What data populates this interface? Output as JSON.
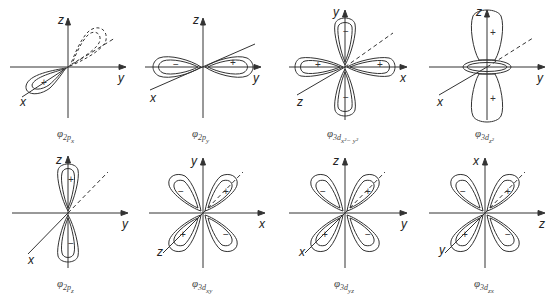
{
  "figure": {
    "stroke_color": "#333333",
    "background": "#ffffff",
    "orbitals": [
      {
        "id": "2px",
        "caption_main": "φ",
        "caption_sub": "2p",
        "caption_subsub": "x",
        "axes": {
          "vertical": "z",
          "horizontal": "y",
          "diagonal": "x"
        },
        "lobes": [
          {
            "sign": "+",
            "direction": "along -x (front-left)",
            "style": "solid"
          },
          {
            "sign": "",
            "direction": "along +x (back-right)",
            "style": "dashed"
          }
        ]
      },
      {
        "id": "2py",
        "caption_main": "φ",
        "caption_sub": "2p",
        "caption_subsub": "y",
        "axes": {
          "vertical": "z",
          "horizontal": "y",
          "diagonal": "x"
        },
        "lobes": [
          {
            "sign": "−",
            "direction": "-y"
          },
          {
            "sign": "+",
            "direction": "+y"
          }
        ]
      },
      {
        "id": "3dx2-y2",
        "caption_main": "φ",
        "caption_sub": "3d",
        "caption_subsub": "x²− y²",
        "axes": {
          "vertical": "y",
          "horizontal": "x",
          "diagonal": "z"
        },
        "lobes": [
          {
            "sign": "−",
            "direction": "+y"
          },
          {
            "sign": "−",
            "direction": "-y"
          },
          {
            "sign": "+",
            "direction": "+x"
          },
          {
            "sign": "+",
            "direction": "-x"
          }
        ]
      },
      {
        "id": "3dz2",
        "caption_main": "φ",
        "caption_sub": "3d",
        "caption_subsub": "z²",
        "axes": {
          "vertical": "z",
          "horizontal": "y",
          "diagonal": "x"
        },
        "lobes": [
          {
            "sign": "+",
            "direction": "+z"
          },
          {
            "sign": "+",
            "direction": "-z"
          },
          {
            "sign": "",
            "direction": "torus xy-plane"
          }
        ]
      },
      {
        "id": "2pz",
        "caption_main": "φ",
        "caption_sub": "2p",
        "caption_subsub": "z",
        "axes": {
          "vertical": "z",
          "horizontal": "y",
          "diagonal": "x"
        },
        "lobes": [
          {
            "sign": "+",
            "direction": "+z"
          },
          {
            "sign": "−",
            "direction": "-z"
          }
        ]
      },
      {
        "id": "3dxy",
        "caption_main": "φ",
        "caption_sub": "3d",
        "caption_subsub": "xy",
        "axes": {
          "vertical": "y",
          "horizontal": "x",
          "diagonal": "z"
        },
        "lobes": [
          {
            "sign": "−",
            "direction": "upper-left"
          },
          {
            "sign": "+",
            "direction": "upper-right"
          },
          {
            "sign": "+",
            "direction": "lower-left"
          },
          {
            "sign": "−",
            "direction": "lower-right"
          }
        ]
      },
      {
        "id": "3dyz",
        "caption_main": "φ",
        "caption_sub": "3d",
        "caption_subsub": "yz",
        "axes": {
          "vertical": "z",
          "horizontal": "y",
          "diagonal": "x"
        },
        "lobes": [
          {
            "sign": "−",
            "direction": "upper-left"
          },
          {
            "sign": "+",
            "direction": "upper-right"
          },
          {
            "sign": "+",
            "direction": "lower-left"
          },
          {
            "sign": "−",
            "direction": "lower-right"
          }
        ]
      },
      {
        "id": "3dzx",
        "caption_main": "φ",
        "caption_sub": "3d",
        "caption_subsub": "zx",
        "axes": {
          "vertical": "x",
          "horizontal": "z",
          "diagonal": "y"
        },
        "lobes": [
          {
            "sign": "−",
            "direction": "upper-left"
          },
          {
            "sign": "+",
            "direction": "upper-right"
          },
          {
            "sign": "+",
            "direction": "lower-left"
          },
          {
            "sign": "−",
            "direction": "lower-right"
          }
        ]
      }
    ]
  }
}
